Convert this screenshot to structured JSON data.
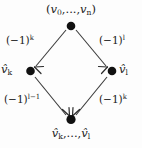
{
  "diagram": {
    "background_color": "#fdfdfd",
    "ink_color": "#1a1a1a",
    "nodes": [
      {
        "id": "top",
        "label": "(v0,...,vn)",
        "position": {
          "x": 71,
          "y": 25
        }
      },
      {
        "id": "left",
        "label": "v̂k",
        "position": {
          "x": 30,
          "y": 71
        }
      },
      {
        "id": "right",
        "label": "v̂l",
        "position": {
          "x": 112,
          "y": 71
        }
      },
      {
        "id": "bottom",
        "label": "v̂k,...,v̂l",
        "position": {
          "x": 71,
          "y": 120
        }
      }
    ],
    "edges": [
      {
        "id": "top-left",
        "from": "top",
        "to": "left",
        "label": "(-1)^k",
        "label_base": "(−1)",
        "label_exponent": "k"
      },
      {
        "id": "top-right",
        "from": "top",
        "to": "right",
        "label": "(-1)^l",
        "label_base": "(−1)",
        "label_exponent": "l"
      },
      {
        "id": "bottom-left",
        "from": "left",
        "to": "bottom",
        "label": "(-1)^(l-1)",
        "label_base": "(−1)",
        "label_exponent": "l−1"
      },
      {
        "id": "bottom-right",
        "from": "right",
        "to": "bottom",
        "label": "(-1)^k",
        "label_base": "(−1)",
        "label_exponent": "k"
      }
    ],
    "node_text": {
      "top_open": "(",
      "top_v": "v",
      "top_sub_0": "0",
      "top_ellipsis": ",...,",
      "top_v2": "v",
      "top_sub_n": "n",
      "top_close": ")",
      "left_v": "v",
      "left_sub": "k",
      "right_v": "v",
      "right_sub": "l",
      "bottom_v1": "v",
      "bottom_sub1": "k",
      "bottom_ellipsis": ",...,",
      "bottom_v2": "v",
      "bottom_sub2": "l"
    }
  }
}
